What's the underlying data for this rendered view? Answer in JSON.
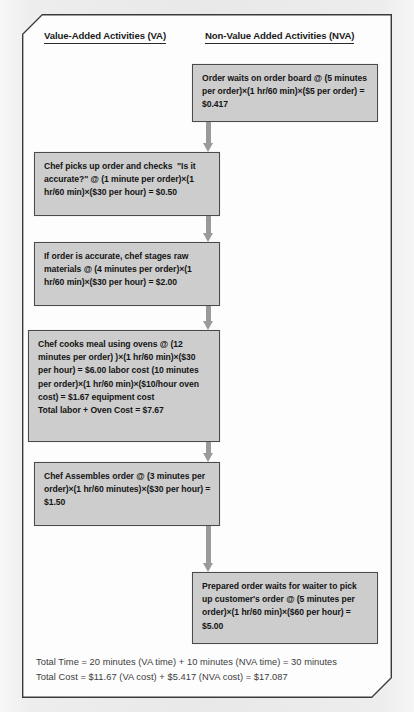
{
  "diagram": {
    "title_bar": "",
    "columns": {
      "va_header": "Value-Added Activities (VA)",
      "nva_header": "Non-Value Added Activities (NVA)"
    },
    "nodes": {
      "nva_1": "Order waits on order board @ (5 minutes per order)×(1 hr/60 min)×($5 per order) = $0.417",
      "va_1": "Chef picks up order and checks  \"Is it accurate?\" @ (1 minute per order)×(1 hr/60 min)×($30 per hour) = $0.50",
      "va_2": "If order is accurate, chef stages raw materials @ (4 minutes per order)×(1 hr/60 min)×($30 per hour) = $2.00",
      "va_3": "Chef cooks meal using ovens @ (12 minutes per order) )×(1 hr/60 min)×($30 per hour) = $6.00 labor cost (10 minutes per order)×(1 hr/60 min)×($10/hour oven cost) = $1.67 equipment cost\nTotal labor + Oven Cost = $7.67",
      "va_4": "Chef Assembles order @ (3 minutes per order)×(1 hr/60 minutes)×($30 per hour) = $1.50",
      "nva_2": "Prepared order waits for waiter to pick up customer's order @ (5 minutes per order)×(1 hr/60 min)×($60 per hour) = $5.00"
    },
    "summary": {
      "line_1": "Total Time = 20 minutes (VA time) + 10 minutes (NVA time) = 30 minutes",
      "line_2": "Total Cost = $11.67 (VA cost) + $5.417 (NVA cost) = $17.087"
    },
    "colors": {
      "node_fill": "#cdcdcd",
      "node_border": "#4a4a4a",
      "arrow": "#9a9a9a",
      "frame_border": "#3a3a3a",
      "page_bg": "#ededed",
      "canvas_bg": "#fdfdfd",
      "text": "#141414",
      "summary_text": "#3c3c3c"
    }
  }
}
